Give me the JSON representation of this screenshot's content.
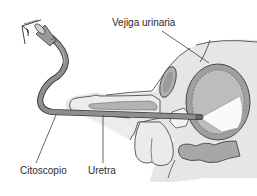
{
  "figure": {
    "labels": {
      "bladder": "Vejiga urinaria",
      "cystoscope": "Citoscopio",
      "urethra": "Uretra"
    },
    "colors": {
      "background": "#ffffff",
      "body_fill": "#e4e4e4",
      "organ_fill": "#a9a9a9",
      "cystoscope_fill": "#8a8a8a",
      "outline": "#3a3a3a",
      "light_cone": "#ffffff"
    },
    "icons": [
      "eye-icon"
    ]
  }
}
